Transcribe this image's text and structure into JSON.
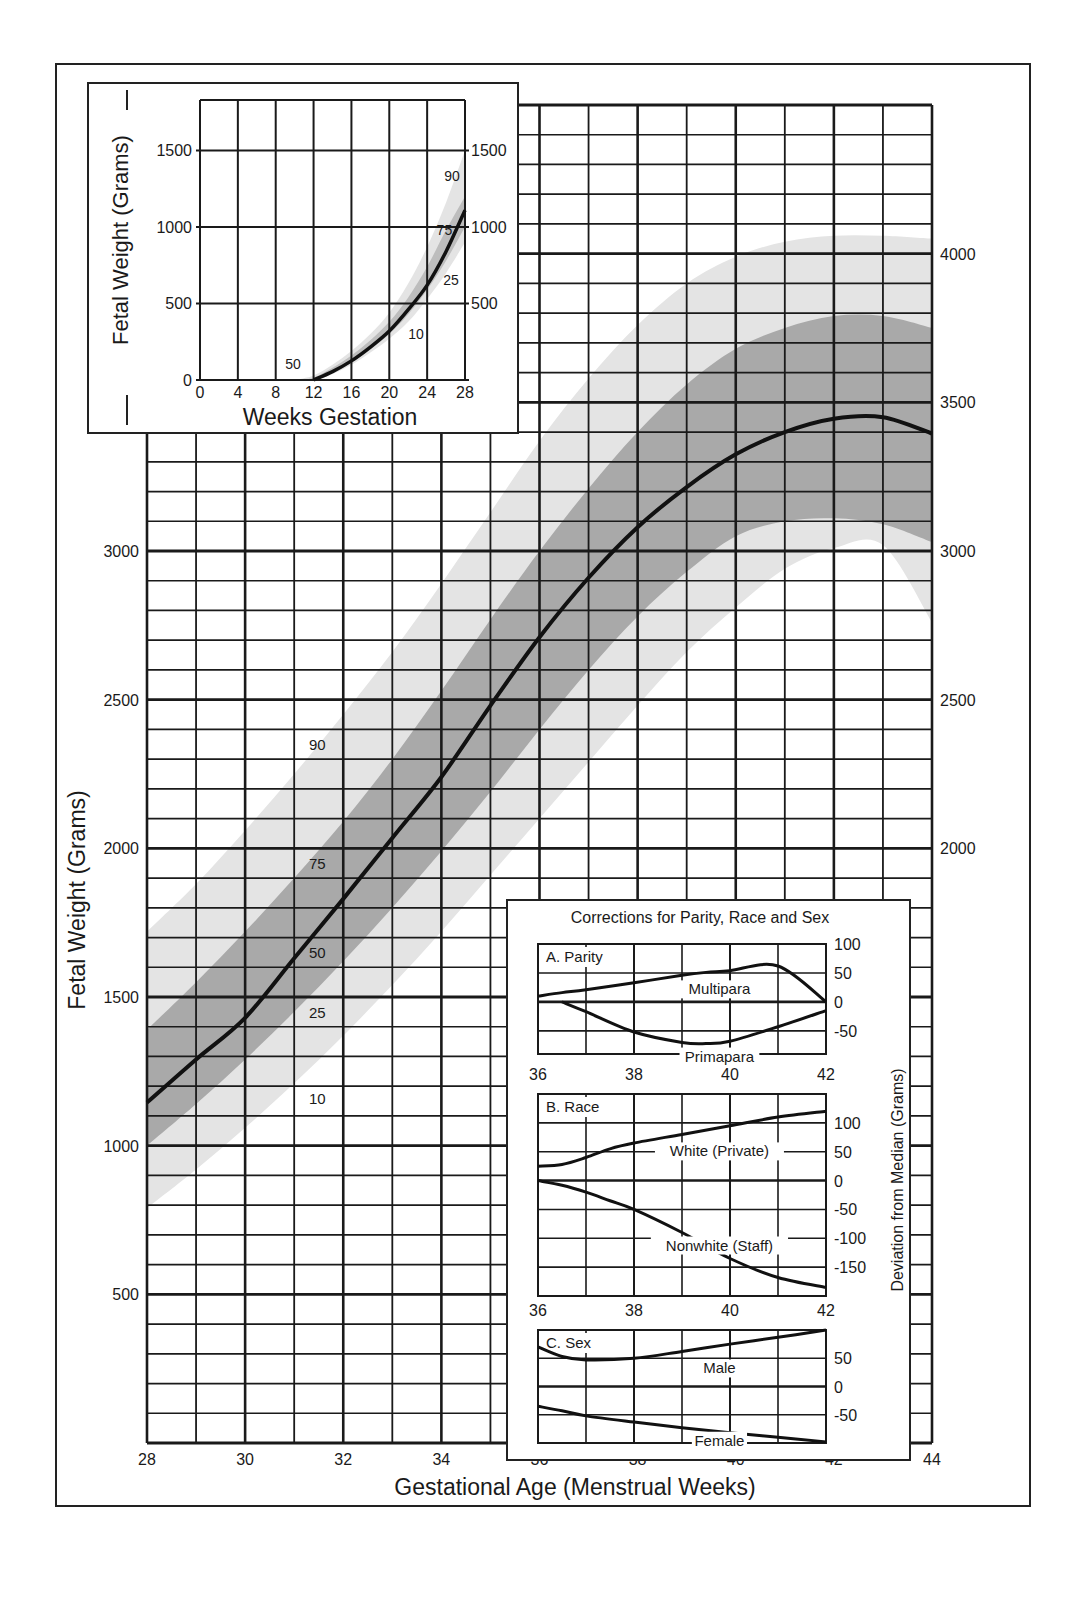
{
  "chart_data": [
    {
      "id": "main",
      "type": "line",
      "title": "",
      "xlabel": "Gestational Age (Menstrual Weeks)",
      "ylabel": "Fetal Weight (Grams)",
      "xlim": [
        28,
        44
      ],
      "ylim": [
        0,
        4500
      ],
      "x_ticks": [
        28,
        30,
        32,
        34,
        36,
        38,
        40,
        42,
        44
      ],
      "y_ticks_left": [
        500,
        1000,
        1500,
        2000,
        2500,
        3000
      ],
      "y_ticks_right": [
        2000,
        2500,
        3000,
        3500,
        4000
      ],
      "grid": {
        "x_minor_step": 1,
        "x_major_step": 2,
        "y_minor_step": 100,
        "y_major_step": 500
      },
      "x": [
        28,
        29,
        30,
        31,
        32,
        33,
        34,
        35,
        36,
        37,
        38,
        39,
        40,
        41,
        42,
        43,
        44
      ],
      "series": [
        {
          "name": "10th percentile",
          "label": "10",
          "values": [
            790,
            920,
            1060,
            1210,
            1370,
            1540,
            1720,
            1910,
            2100,
            2290,
            2480,
            2660,
            2810,
            2940,
            3010,
            3020,
            2760
          ]
        },
        {
          "name": "25th percentile",
          "label": "25",
          "values": [
            1000,
            1140,
            1290,
            1450,
            1620,
            1800,
            1990,
            2190,
            2400,
            2600,
            2780,
            2930,
            3050,
            3100,
            3110,
            3090,
            3030
          ]
        },
        {
          "name": "50th percentile (median)",
          "label": "50",
          "values": [
            1145,
            1290,
            1430,
            1630,
            1830,
            2035,
            2240,
            2480,
            2710,
            2910,
            3080,
            3215,
            3325,
            3400,
            3445,
            3450,
            3395
          ]
        },
        {
          "name": "75th percentile",
          "label": "75",
          "values": [
            1390,
            1550,
            1720,
            1900,
            2090,
            2300,
            2530,
            2770,
            3000,
            3210,
            3400,
            3560,
            3680,
            3750,
            3790,
            3790,
            3750
          ]
        },
        {
          "name": "90th percentile",
          "label": "90",
          "values": [
            1720,
            1880,
            2060,
            2250,
            2450,
            2660,
            2890,
            3130,
            3370,
            3580,
            3760,
            3900,
            3990,
            4040,
            4060,
            4060,
            4050
          ]
        }
      ],
      "band_labels": [
        {
          "text": "90",
          "x": 31.3,
          "y": 2330
        },
        {
          "text": "75",
          "x": 31.3,
          "y": 1930
        },
        {
          "text": "50",
          "x": 31.3,
          "y": 1630
        },
        {
          "text": "25",
          "x": 31.3,
          "y": 1430
        },
        {
          "text": "10",
          "x": 31.3,
          "y": 1140
        }
      ],
      "fills": {
        "outer_band_10_90": "#e4e4e4",
        "inner_band_25_75": "#a9a9a9",
        "median_line": "#111111"
      }
    },
    {
      "id": "early_inset",
      "type": "line",
      "title": "",
      "xlabel": "Weeks Gestation",
      "ylabel": "Fetal Weight (Grams)",
      "xlim": [
        0,
        28
      ],
      "ylim": [
        0,
        1830
      ],
      "x_ticks": [
        0,
        4,
        8,
        12,
        16,
        20,
        24,
        28
      ],
      "y_ticks_left": [
        0,
        500,
        1000,
        1500
      ],
      "y_ticks_right": [
        500,
        1000,
        1500
      ],
      "x": [
        10,
        12,
        14,
        16,
        18,
        20,
        22,
        24,
        26,
        28
      ],
      "series": [
        {
          "name": "10th percentile",
          "label": "10",
          "values": [
            0,
            0,
            40,
            100,
            180,
            270,
            380,
            530,
            700,
            900
          ]
        },
        {
          "name": "25th percentile",
          "label": "25",
          "values": [
            0,
            5,
            50,
            115,
            200,
            300,
            430,
            590,
            780,
            1000
          ]
        },
        {
          "name": "50th percentile (median)",
          "label": "50",
          "values": [
            0,
            0,
            55,
            125,
            215,
            320,
            460,
            620,
            840,
            1110
          ]
        },
        {
          "name": "75th percentile",
          "label": "75",
          "values": [
            0,
            15,
            80,
            160,
            260,
            380,
            540,
            740,
            980,
            1200
          ]
        },
        {
          "name": "90th percentile",
          "label": "90",
          "values": [
            0,
            30,
            100,
            190,
            300,
            440,
            630,
            870,
            1160,
            1500
          ]
        }
      ],
      "band_labels": [
        {
          "text": "90",
          "x": 25.8,
          "y": 1300
        },
        {
          "text": "75",
          "x": 25.0,
          "y": 950
        },
        {
          "text": "25",
          "x": 25.7,
          "y": 620
        },
        {
          "text": "10",
          "x": 22.0,
          "y": 270
        },
        {
          "text": "50",
          "x": 9.0,
          "y": 70
        }
      ]
    },
    {
      "id": "corrections",
      "type": "line",
      "title": "Corrections for Parity, Race and Sex",
      "ylabel": "Deviation from Median (Grams)",
      "panels": [
        {
          "title": "A. Parity",
          "xlim": [
            36,
            42
          ],
          "ylim": [
            -90,
            100
          ],
          "x_ticks": [
            36,
            38,
            40,
            42
          ],
          "y_ticks": [
            100,
            50,
            0,
            -50
          ],
          "x": [
            36,
            36.5,
            37,
            38,
            39,
            39.5,
            40,
            41,
            42
          ],
          "series": [
            {
              "name": "Multipara",
              "values": [
                10,
                16,
                21,
                33,
                46,
                51,
                54,
                62,
                0
              ]
            },
            {
              "name": "Primapara",
              "values": [
                null,
                0,
                -17,
                -52,
                -70,
                -72,
                -68,
                -43,
                -15
              ]
            }
          ]
        },
        {
          "title": "B. Race",
          "xlim": [
            36,
            42
          ],
          "ylim": [
            -200,
            150
          ],
          "x_ticks": [
            36,
            38,
            40,
            42
          ],
          "y_ticks": [
            100,
            50,
            0,
            -50,
            -100,
            -150
          ],
          "x": [
            36,
            36.5,
            37,
            37.5,
            38,
            39,
            40,
            41,
            42
          ],
          "series": [
            {
              "name": "White (Private)",
              "values": [
                25,
                28,
                40,
                55,
                65,
                80,
                95,
                110,
                120
              ]
            },
            {
              "name": "Nonwhite (Staff)",
              "values": [
                0,
                -8,
                -20,
                -35,
                -50,
                -90,
                -135,
                -168,
                -185
              ]
            }
          ]
        },
        {
          "title": "C. Sex",
          "xlim": [
            36,
            42
          ],
          "ylim": [
            -100,
            100
          ],
          "x_ticks": [
            36,
            38,
            40,
            42
          ],
          "y_ticks": [
            50,
            0,
            -50
          ],
          "x": [
            36,
            36.5,
            37,
            38,
            39,
            40,
            41,
            42
          ],
          "series": [
            {
              "name": "Male",
              "values": [
                70,
                53,
                47,
                50,
                62,
                75,
                87,
                100
              ]
            },
            {
              "name": "Female",
              "values": [
                -35,
                -43,
                -52,
                -63,
                -73,
                -82,
                -90,
                -98
              ]
            }
          ]
        }
      ]
    }
  ]
}
